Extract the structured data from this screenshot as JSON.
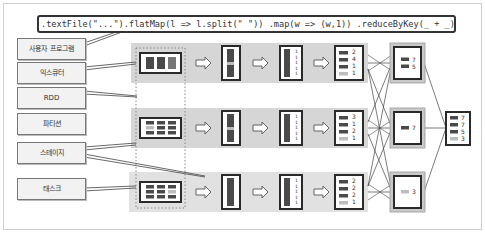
{
  "code": {
    "text": ".textFile(\"...\").flatMap(l => l.split(\" \")) .map(w => (w,1)) .reduceByKey(_ + _)"
  },
  "labels": [
    {
      "id": "user-program",
      "text": "사용자 프로그램"
    },
    {
      "id": "executor",
      "text": "익스큐터"
    },
    {
      "id": "rdd",
      "text": "RDD"
    },
    {
      "id": "partition",
      "text": "파티션"
    },
    {
      "id": "stage",
      "text": "스테이지"
    },
    {
      "id": "task",
      "text": "태스크"
    }
  ],
  "executors": [
    {
      "counts_flatmap": [
        "1",
        "1",
        "1",
        "1",
        "1"
      ],
      "reduced": [
        "2",
        "4",
        "1",
        "1"
      ]
    },
    {
      "counts_flatmap": [
        "1",
        "1",
        "1",
        "1",
        "1"
      ],
      "reduced": [
        "3",
        "1",
        "2",
        "1"
      ]
    },
    {
      "counts_flatmap": [
        "1",
        "1",
        "1",
        "1",
        "1"
      ],
      "reduced": [
        "2",
        "2",
        "2",
        "1"
      ]
    }
  ],
  "shuffle_partitions": [
    {
      "values": [
        "7",
        "5"
      ]
    },
    {
      "values": [
        "7"
      ]
    },
    {
      "values": [
        "3"
      ]
    }
  ],
  "final_result": {
    "values": [
      "7",
      "7",
      "5",
      "3"
    ]
  },
  "colors": {
    "executor_bg": "#d6d6d6",
    "dark_block": "#4a4a4a",
    "light_block": "#bdbdbd",
    "border": "#2a2a2a"
  }
}
